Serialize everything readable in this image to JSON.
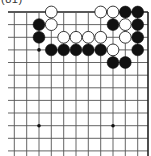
{
  "diagram": {
    "label": "(81)",
    "colors": {
      "background": "#ffffff",
      "grid": "#555555",
      "edge": "#222222",
      "black_stone": "#111111",
      "white_stone": "#ffffff",
      "white_stroke": "#222222",
      "star": "#111111"
    },
    "grid": {
      "col_x": [
        14.3,
        26.7,
        39,
        51.3,
        63.7,
        76,
        88.3,
        100.7,
        113,
        125.3,
        137.7,
        148
      ],
      "row_y": [
        12,
        24.6,
        37.3,
        49.9,
        62.5,
        75.2,
        87.8,
        100.4,
        113,
        125.7,
        138.3,
        150.9
      ],
      "left_extend_x": 8,
      "bottom_extend_y": 156,
      "top_edge": true,
      "right_edge": true
    },
    "star_points": [
      {
        "col": 2,
        "row": 3
      },
      {
        "col": 2,
        "row": 9
      },
      {
        "col": 8,
        "row": 9
      }
    ],
    "stones": [
      {
        "color": "white",
        "col": 3,
        "row": 0
      },
      {
        "color": "white",
        "col": 7,
        "row": 0
      },
      {
        "color": "white",
        "col": 8,
        "row": 0
      },
      {
        "color": "black",
        "col": 9,
        "row": 0
      },
      {
        "color": "black",
        "col": 10,
        "row": 0
      },
      {
        "color": "black",
        "col": 2,
        "row": 1
      },
      {
        "color": "white",
        "col": 3,
        "row": 1
      },
      {
        "color": "black",
        "col": 8,
        "row": 1
      },
      {
        "color": "white",
        "col": 9,
        "row": 1
      },
      {
        "color": "black",
        "col": 10,
        "row": 1
      },
      {
        "color": "black",
        "col": 2,
        "row": 2
      },
      {
        "color": "white",
        "col": 4,
        "row": 2
      },
      {
        "color": "white",
        "col": 5,
        "row": 2
      },
      {
        "color": "white",
        "col": 6,
        "row": 2
      },
      {
        "color": "white",
        "col": 7,
        "row": 2
      },
      {
        "color": "white",
        "col": 9,
        "row": 2
      },
      {
        "color": "black",
        "col": 10,
        "row": 2
      },
      {
        "color": "black",
        "col": 3,
        "row": 3
      },
      {
        "color": "black",
        "col": 4,
        "row": 3
      },
      {
        "color": "black",
        "col": 5,
        "row": 3
      },
      {
        "color": "black",
        "col": 6,
        "row": 3
      },
      {
        "color": "black",
        "col": 7,
        "row": 3
      },
      {
        "color": "white",
        "col": 8,
        "row": 3
      },
      {
        "color": "black",
        "col": 10,
        "row": 3
      },
      {
        "color": "black",
        "col": 8,
        "row": 4
      },
      {
        "color": "black",
        "col": 9,
        "row": 4
      }
    ],
    "stone_radius": 5.9
  }
}
